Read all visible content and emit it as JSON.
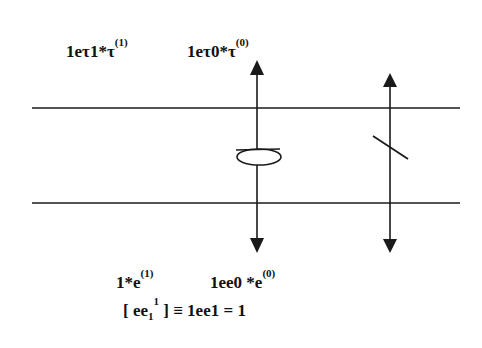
{
  "diagram": {
    "top_labels": {
      "left": {
        "base": "1eτ1*τ",
        "sup": "(1)"
      },
      "right": {
        "base": "1eτ0*τ",
        "sup": "(0)"
      }
    },
    "bottom_labels": {
      "left": {
        "base": "1*e",
        "sup": "(1)"
      },
      "right": {
        "base": "1ee0 *e",
        "sup": "(0)"
      }
    },
    "equation": {
      "open": "[ ee",
      "sub": "1",
      "sup": "1",
      "rest": " ] ≡ 1ee1 = 1"
    },
    "colors": {
      "stroke": "#1a1a1a",
      "background": "#ffffff"
    }
  }
}
